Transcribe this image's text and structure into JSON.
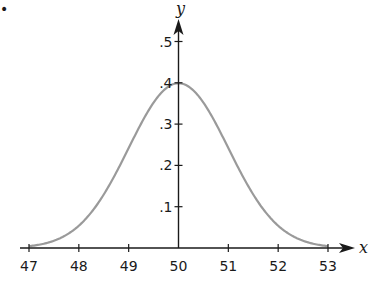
{
  "chart_data": {
    "type": "line",
    "title": "",
    "xlabel": "x",
    "ylabel": "y",
    "xlim": [
      47,
      53
    ],
    "ylim": [
      0,
      0.5
    ],
    "grid": false,
    "legend": null,
    "x_ticks": [
      "47",
      "48",
      "49",
      "50",
      "51",
      "52",
      "53"
    ],
    "x_tick_values": [
      47,
      48,
      49,
      50,
      51,
      52,
      53
    ],
    "y_ticks": [
      ".1",
      ".2",
      ".3",
      ".4",
      ".5"
    ],
    "y_tick_values": [
      0.1,
      0.2,
      0.3,
      0.4,
      0.5
    ],
    "series": [
      {
        "name": "normal curve",
        "distribution": "normal",
        "mean": 50,
        "std_dev": 1,
        "x": [
          47,
          47.5,
          48,
          48.5,
          49,
          49.5,
          50,
          50.5,
          51,
          51.5,
          52,
          52.5,
          53
        ],
        "y": [
          0.004,
          0.018,
          0.054,
          0.13,
          0.242,
          0.352,
          0.399,
          0.352,
          0.242,
          0.13,
          0.054,
          0.018,
          0.004
        ],
        "color": "#9a9a9a"
      }
    ],
    "axis_color": "#1a1a1a"
  },
  "marker": "•"
}
